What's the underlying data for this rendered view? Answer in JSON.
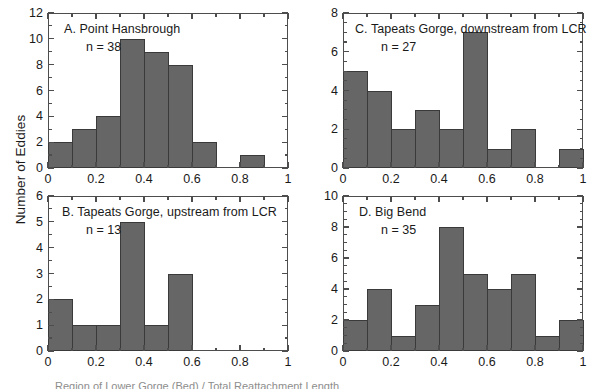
{
  "figure": {
    "ylabel": "Number of Eddies",
    "xlabel_partial": "Region of Lower Gorge (Bed) / Total Reattachment Length",
    "bar_color": "#666666",
    "bar_edge_color": "#3a3a3a",
    "axis_color": "#4d4d4d"
  },
  "chart_data": [
    {
      "type": "bar",
      "panel": "A",
      "title": "A. Point Hansbrough",
      "n_label": "n = 38",
      "n": 38,
      "bin_edges": [
        0,
        0.1,
        0.2,
        0.3,
        0.4,
        0.5,
        0.6,
        0.7,
        0.8,
        0.9,
        1.0
      ],
      "categories": [
        "0-0.1",
        "0.1-0.2",
        "0.2-0.3",
        "0.3-0.4",
        "0.4-0.5",
        "0.5-0.6",
        "0.6-0.7",
        "0.7-0.8",
        "0.8-0.9",
        "0.9-1.0"
      ],
      "values": [
        2,
        3,
        4,
        10,
        9,
        8,
        2,
        0,
        1,
        0
      ],
      "xlabel": "",
      "ylabel": "Number of Eddies",
      "xlim": [
        0,
        1
      ],
      "ylim": [
        0,
        12
      ],
      "ytick_major": 2,
      "ytick_minor": 1,
      "yticks": [
        0,
        2,
        4,
        6,
        8,
        10,
        12
      ],
      "xticks": [
        0,
        0.2,
        0.4,
        0.6,
        0.8,
        1
      ],
      "xtick_labels": [
        "0",
        "0.2",
        "0.4",
        "0.6",
        "0.8",
        "1"
      ],
      "grid": false,
      "legend": "none"
    },
    {
      "type": "bar",
      "panel": "B",
      "title": "B. Tapeats Gorge, upstream from LCR",
      "n_label": "n = 13",
      "n": 13,
      "bin_edges": [
        0,
        0.1,
        0.2,
        0.3,
        0.4,
        0.5,
        0.6,
        0.7,
        0.8,
        0.9,
        1.0
      ],
      "categories": [
        "0-0.1",
        "0.1-0.2",
        "0.2-0.3",
        "0.3-0.4",
        "0.4-0.5",
        "0.5-0.6",
        "0.6-0.7",
        "0.7-0.8",
        "0.8-0.9",
        "0.9-1.0"
      ],
      "values": [
        2,
        1,
        1,
        5,
        1,
        3,
        0,
        0,
        0,
        0
      ],
      "xlabel": "",
      "ylabel": "Number of Eddies",
      "xlim": [
        0,
        1
      ],
      "ylim": [
        0,
        6
      ],
      "ytick_major": 1,
      "ytick_minor": 0.5,
      "yticks": [
        0,
        1,
        2,
        3,
        4,
        5,
        6
      ],
      "xticks": [
        0,
        0.2,
        0.4,
        0.6,
        0.8,
        1
      ],
      "xtick_labels": [
        "0",
        "0.2",
        "0.4",
        "0.6",
        "0.8",
        "1"
      ],
      "grid": false,
      "legend": "none"
    },
    {
      "type": "bar",
      "panel": "C",
      "title": "C. Tapeats Gorge, downstream from LCR",
      "n_label": "n = 27",
      "n": 27,
      "bin_edges": [
        0,
        0.1,
        0.2,
        0.3,
        0.4,
        0.5,
        0.6,
        0.7,
        0.8,
        0.9,
        1.0
      ],
      "categories": [
        "0-0.1",
        "0.1-0.2",
        "0.2-0.3",
        "0.3-0.4",
        "0.4-0.5",
        "0.5-0.6",
        "0.6-0.7",
        "0.7-0.8",
        "0.8-0.9",
        "0.9-1.0"
      ],
      "values": [
        5,
        4,
        2,
        3,
        2,
        7,
        1,
        2,
        0,
        1
      ],
      "xlabel": "",
      "ylabel": "",
      "xlim": [
        0,
        1
      ],
      "ylim": [
        0,
        8
      ],
      "ytick_major": 2,
      "ytick_minor": 0.5,
      "yticks": [
        0,
        2,
        4,
        6,
        8
      ],
      "xticks": [
        0,
        0.2,
        0.4,
        0.6,
        0.8,
        1
      ],
      "xtick_labels": [
        "0",
        "0.2",
        "0.4",
        "0.6",
        "0.8",
        "1"
      ],
      "grid": false,
      "legend": "none"
    },
    {
      "type": "bar",
      "panel": "D",
      "title": "D. Big Bend",
      "n_label": "n = 35",
      "n": 35,
      "bin_edges": [
        0,
        0.1,
        0.2,
        0.3,
        0.4,
        0.5,
        0.6,
        0.7,
        0.8,
        0.9,
        1.0
      ],
      "categories": [
        "0-0.1",
        "0.1-0.2",
        "0.2-0.3",
        "0.3-0.4",
        "0.4-0.5",
        "0.5-0.6",
        "0.6-0.7",
        "0.7-0.8",
        "0.8-0.9",
        "0.9-1.0"
      ],
      "values": [
        2,
        4,
        1,
        3,
        8,
        5,
        4,
        5,
        1,
        2
      ],
      "xlabel": "",
      "ylabel": "",
      "xlim": [
        0,
        1
      ],
      "ylim": [
        0,
        10
      ],
      "ytick_major": 2,
      "ytick_minor": 0.5,
      "yticks": [
        0,
        2,
        4,
        6,
        8,
        10
      ],
      "xticks": [
        0,
        0.2,
        0.4,
        0.6,
        0.8,
        1
      ],
      "xtick_labels": [
        "0",
        "0.2",
        "0.4",
        "0.6",
        "0.8",
        "1"
      ],
      "grid": false,
      "legend": "none"
    }
  ]
}
